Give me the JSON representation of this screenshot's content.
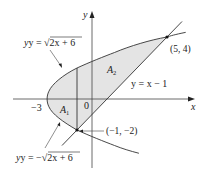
{
  "diagram": {
    "type": "area-between-curves",
    "axes": {
      "x_label": "x",
      "y_label": "y",
      "origin_label": "0",
      "tick_labels": [
        {
          "value": -3,
          "text": "−3"
        }
      ]
    },
    "curves": [
      {
        "id": "upper-parabola",
        "label_prefix": "y = ",
        "label_radical": "2x + 6",
        "equation": "y = √(2x + 6)"
      },
      {
        "id": "lower-parabola",
        "label_prefix": "y = −",
        "label_radical": "2x + 6",
        "equation": "y = −√(2x + 6)"
      },
      {
        "id": "line",
        "label": "y = x − 1",
        "equation": "y = x − 1"
      }
    ],
    "regions": [
      {
        "id": "A1",
        "label_main": "A",
        "label_sub": "1"
      },
      {
        "id": "A2",
        "label_main": "A",
        "label_sub": "2"
      }
    ],
    "points": [
      {
        "label": "(5, 4)",
        "x": 5,
        "y": 4
      },
      {
        "label": "(−1, −2)",
        "x": -1,
        "y": -2
      }
    ],
    "divider": {
      "x": -1
    },
    "colors": {
      "shading": "#e4e4e4",
      "stroke": "#333333",
      "axis": "#444444",
      "text": "#222222"
    }
  }
}
